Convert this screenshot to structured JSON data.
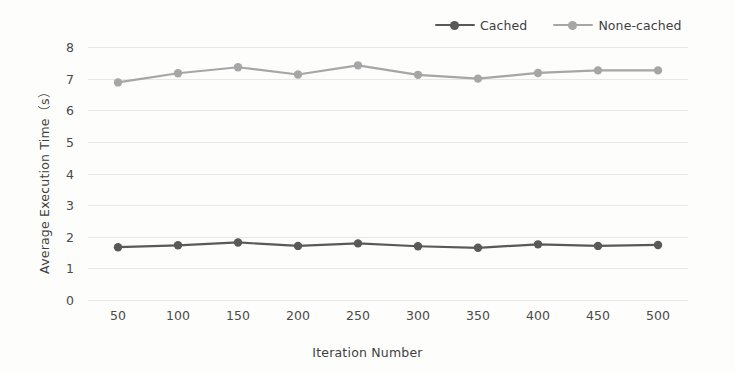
{
  "chart_data": {
    "type": "line",
    "title": "",
    "xlabel": "Iteration Number",
    "ylabel": "Average Execution Time（s）",
    "x": [
      50,
      100,
      150,
      200,
      250,
      300,
      350,
      400,
      450,
      500
    ],
    "categories": [
      "50",
      "100",
      "150",
      "200",
      "250",
      "300",
      "350",
      "400",
      "450",
      "500"
    ],
    "yticks": [
      "0",
      "1",
      "2",
      "3",
      "4",
      "5",
      "6",
      "7",
      "8"
    ],
    "ytick_values": [
      0,
      1,
      2,
      3,
      4,
      5,
      6,
      7,
      8
    ],
    "ylim": [
      0,
      8
    ],
    "grid": true,
    "legend_position": "top-right",
    "series": [
      {
        "name": "Cached",
        "color": "#595959",
        "marker": "circle",
        "values": [
          1.67,
          1.73,
          1.82,
          1.71,
          1.79,
          1.7,
          1.65,
          1.76,
          1.71,
          1.74
        ]
      },
      {
        "name": "None-cached",
        "color": "#a6a6a6",
        "marker": "circle",
        "values": [
          6.88,
          7.17,
          7.36,
          7.13,
          7.42,
          7.12,
          7.0,
          7.18,
          7.26,
          7.26
        ]
      }
    ]
  },
  "legend": {
    "entries": [
      {
        "label": "Cached"
      },
      {
        "label": "None-cached"
      }
    ]
  },
  "axes": {
    "x_title": "Iteration Number",
    "y_title": "Average Execution Time（s）"
  },
  "colors": {
    "cached": "#595959",
    "none_cached": "#a6a6a6",
    "grid": "#e9e7e4",
    "text": "#4a4a4a",
    "background": "#fdfdfc"
  }
}
